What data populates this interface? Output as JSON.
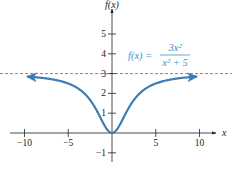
{
  "chart_data": {
    "type": "line",
    "title": "",
    "xlabel": "x",
    "ylabel": "f(x)",
    "xlim": [
      -12,
      12
    ],
    "ylim": [
      -1.2,
      5.8
    ],
    "x_ticks": [
      -10,
      -5,
      5,
      10
    ],
    "x_tick_labels": [
      "−10",
      "−5",
      "5",
      "10"
    ],
    "y_ticks": [
      -1,
      1,
      2,
      3,
      4,
      5
    ],
    "y_tick_labels": [
      "−1",
      "1",
      "2",
      "3",
      "4",
      "5"
    ],
    "grid": false,
    "legend": null,
    "series": [
      {
        "name": "f(x) = 3x^2/(x^2+5)",
        "function": "3*x*x/(x*x+5)",
        "x_range": [
          -9.6,
          9.6
        ],
        "color": "#3d7db5",
        "arrows_both_ends": true,
        "x": [
          -10,
          -5,
          -2,
          -1,
          0,
          1,
          2,
          5,
          10
        ],
        "values": [
          2.86,
          2.5,
          1.33,
          0.5,
          0,
          0.5,
          1.33,
          2.5,
          2.86
        ]
      }
    ],
    "annotations": [
      {
        "type": "horizontal_asymptote",
        "y": 3,
        "style": "dashed",
        "color": "#e0604a"
      },
      {
        "type": "equation_label",
        "lhs": "f(x) =",
        "numerator": "3x²",
        "denominator": "x² + 5",
        "color": "#4a8fc4"
      }
    ]
  },
  "labels": {
    "x_axis": "x",
    "y_axis": "f(x)",
    "eq_lhs": "f(x) =",
    "eq_num": "3x²",
    "eq_den": "x² + 5"
  }
}
